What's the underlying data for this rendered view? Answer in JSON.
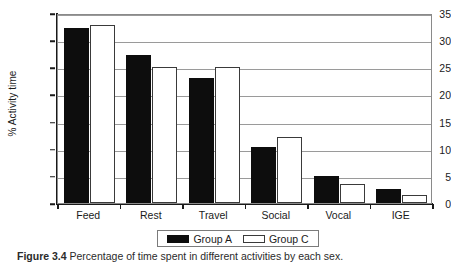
{
  "chart_data": {
    "type": "bar",
    "title": "",
    "xlabel": "",
    "ylabel": "% Activity time",
    "categories": [
      "Feed",
      "Rest",
      "Travel",
      "Social",
      "Vocal",
      "IGE"
    ],
    "series": [
      {
        "name": "Group A",
        "color": "#0d0d0d",
        "values": [
          32.2,
          27.2,
          23.0,
          10.3,
          5.0,
          2.6
        ]
      },
      {
        "name": "Group C",
        "color": "#ffffff",
        "values": [
          32.8,
          25.0,
          25.0,
          12.1,
          3.5,
          1.5
        ]
      }
    ],
    "ylim": [
      0,
      35
    ],
    "yticks": [
      0,
      5,
      10,
      15,
      20,
      25,
      30,
      35
    ],
    "ytick_labels": [
      "0",
      "5",
      "10",
      "15",
      "20",
      "25",
      "30",
      "35"
    ],
    "grid": true,
    "legend_position": "below-axis-center"
  },
  "legend": {
    "entries": [
      {
        "label": "Group A",
        "swatch": "filled-black-square"
      },
      {
        "label": "Group C",
        "swatch": "open-white-square"
      }
    ]
  },
  "caption": {
    "figure_number": "Figure 3.4",
    "text": "Percentage of time spent in different activities by each sex."
  }
}
